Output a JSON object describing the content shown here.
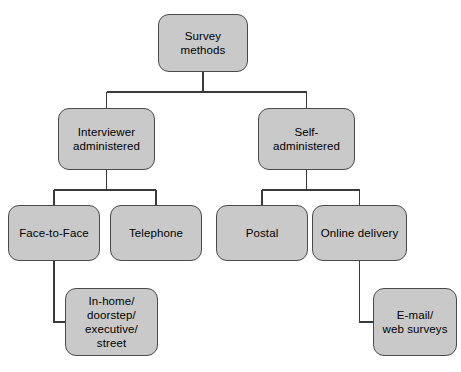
{
  "diagram": {
    "style": {
      "node_fill": "#c9c9c9",
      "node_border": "#4a4a4a",
      "connector_color": "#3a3a3a",
      "background": "#ffffff"
    },
    "nodes": [
      {
        "id": "survey-methods",
        "label": "Survey methods",
        "level": 1,
        "x": 158,
        "y": 14,
        "w": 90,
        "h": 58
      },
      {
        "id": "interviewer-administered",
        "label": "Interviewer\nadministered",
        "level": 2,
        "x": 58,
        "y": 108,
        "w": 97,
        "h": 62
      },
      {
        "id": "self-administered",
        "label": "Self-\nadministered",
        "level": 2,
        "x": 258,
        "y": 108,
        "w": 97,
        "h": 62
      },
      {
        "id": "face-to-face",
        "label": "Face-to-Face",
        "level": 3,
        "x": 8,
        "y": 205,
        "w": 92,
        "h": 56
      },
      {
        "id": "telephone",
        "label": "Telephone",
        "level": 3,
        "x": 110,
        "y": 205,
        "w": 92,
        "h": 56
      },
      {
        "id": "postal",
        "label": "Postal",
        "level": 3,
        "x": 216,
        "y": 205,
        "w": 92,
        "h": 56
      },
      {
        "id": "online-delivery",
        "label": "Online delivery",
        "level": 3,
        "x": 312,
        "y": 205,
        "w": 95,
        "h": 56
      },
      {
        "id": "in-home-doorstep-executive-street",
        "label": "In-home/\ndoorstep/\nexecutive/\nstreet",
        "level": 4,
        "x": 65,
        "y": 288,
        "w": 93,
        "h": 68
      },
      {
        "id": "e-mail-web-surveys",
        "label": "E-mail/\nweb surveys",
        "level": 4,
        "x": 373,
        "y": 288,
        "w": 84,
        "h": 68
      }
    ],
    "edges": [
      {
        "from": "survey-methods",
        "to": "interviewer-administered",
        "type": "orthogonal-down"
      },
      {
        "from": "survey-methods",
        "to": "self-administered",
        "type": "orthogonal-down"
      },
      {
        "from": "interviewer-administered",
        "to": "face-to-face",
        "type": "orthogonal-down"
      },
      {
        "from": "interviewer-administered",
        "to": "telephone",
        "type": "orthogonal-down"
      },
      {
        "from": "self-administered",
        "to": "postal",
        "type": "orthogonal-down"
      },
      {
        "from": "self-administered",
        "to": "online-delivery",
        "type": "orthogonal-down"
      },
      {
        "from": "face-to-face",
        "to": "in-home-doorstep-executive-street",
        "type": "elbow-right"
      },
      {
        "from": "online-delivery",
        "to": "e-mail-web-surveys",
        "type": "elbow-right"
      }
    ]
  }
}
